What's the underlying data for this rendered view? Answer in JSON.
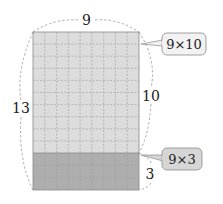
{
  "diagram": {
    "title": "",
    "rectangle": {
      "columns": 9,
      "rows_total": 13,
      "top_section": {
        "rows": 10,
        "fill": "#d9d9d9",
        "label": "9×10"
      },
      "bottom_section": {
        "rows": 3,
        "fill": "#a9a9a9",
        "label": "9×3"
      },
      "grid_line_color": "#9a9a9a",
      "border_color": "#7a7a7a"
    },
    "dimension_labels": {
      "top": "9",
      "left": "13",
      "right_upper": "10",
      "right_lower": "3"
    },
    "callouts": [
      {
        "text": "9×10",
        "fill": "#f2f2f2"
      },
      {
        "text": "9×3",
        "fill": "#d6d6d6"
      }
    ]
  }
}
